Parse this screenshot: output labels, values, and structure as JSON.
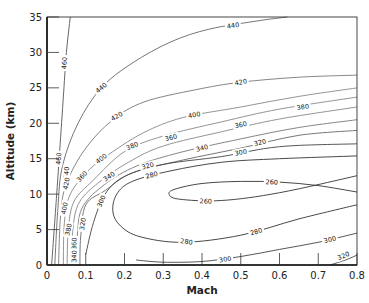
{
  "chart_data": {
    "type": "contour",
    "title": "",
    "xlabel": "Mach",
    "ylabel": "Altitude (km)",
    "xlim": [
      0,
      0.8
    ],
    "ylim": [
      0,
      35
    ],
    "xticks": [
      "0",
      "0.1",
      "0.2",
      "0.3",
      "0.4",
      "0.5",
      "0.6",
      "0.7",
      "0.8"
    ],
    "yticks": [
      "0",
      "5",
      "10",
      "15",
      "20",
      "25",
      "30",
      "35"
    ],
    "grid": false,
    "contours": [
      {
        "level": 460,
        "color": "#555555",
        "points": [
          [
            0.012,
            0
          ],
          [
            0.025,
            10
          ],
          [
            0.035,
            18
          ],
          [
            0.045,
            26
          ],
          [
            0.05,
            30
          ],
          [
            0.06,
            35
          ]
        ],
        "labels": [
          [
            0.045,
            28.5,
            "460"
          ],
          [
            0.03,
            15,
            "460"
          ]
        ]
      },
      {
        "level": 440,
        "color": "#666666",
        "points": [
          [
            0.02,
            0
          ],
          [
            0.028,
            8
          ],
          [
            0.04,
            14
          ],
          [
            0.08,
            20
          ],
          [
            0.14,
            25
          ],
          [
            0.22,
            28.5
          ],
          [
            0.32,
            31.5
          ],
          [
            0.42,
            33.3
          ],
          [
            0.55,
            34.5
          ],
          [
            0.62,
            35
          ]
        ],
        "labels": [
          [
            0.05,
            13,
            "440"
          ],
          [
            0.14,
            25,
            "440"
          ],
          [
            0.48,
            33.8,
            "440"
          ]
        ]
      },
      {
        "level": 420,
        "color": "#777777",
        "points": [
          [
            0.03,
            0
          ],
          [
            0.035,
            7
          ],
          [
            0.05,
            11.5
          ],
          [
            0.1,
            16.5
          ],
          [
            0.17,
            20.5
          ],
          [
            0.25,
            23
          ],
          [
            0.38,
            24.7
          ],
          [
            0.5,
            25.8
          ],
          [
            0.65,
            26.5
          ],
          [
            0.8,
            26.8
          ]
        ],
        "labels": [
          [
            0.05,
            11.5,
            "420"
          ],
          [
            0.18,
            21,
            "420"
          ],
          [
            0.5,
            25.8,
            "420"
          ]
        ]
      },
      {
        "level": 400,
        "color": "#888888",
        "points": [
          [
            0.042,
            0
          ],
          [
            0.045,
            6
          ],
          [
            0.06,
            10
          ],
          [
            0.11,
            13.5
          ],
          [
            0.17,
            16
          ],
          [
            0.25,
            18.7
          ],
          [
            0.35,
            20.8
          ],
          [
            0.5,
            22.3
          ],
          [
            0.65,
            23.8
          ],
          [
            0.8,
            25
          ]
        ],
        "labels": [
          [
            0.045,
            8,
            "400"
          ],
          [
            0.14,
            15,
            "400"
          ],
          [
            0.38,
            21.2,
            "400"
          ]
        ]
      },
      {
        "level": 380,
        "color": "#888888",
        "points": [
          [
            0.052,
            0
          ],
          [
            0.055,
            5
          ],
          [
            0.07,
            9
          ],
          [
            0.12,
            12
          ],
          [
            0.2,
            16
          ],
          [
            0.3,
            18.2
          ],
          [
            0.45,
            20.2
          ],
          [
            0.6,
            22
          ],
          [
            0.8,
            23.7
          ]
        ],
        "labels": [
          [
            0.055,
            5,
            "380"
          ],
          [
            0.22,
            16.8,
            "380"
          ],
          [
            0.66,
            22.3,
            "380"
          ]
        ]
      },
      {
        "level": 360,
        "color": "#888888",
        "points": [
          [
            0.062,
            0
          ],
          [
            0.065,
            4
          ],
          [
            0.08,
            8.5
          ],
          [
            0.13,
            11.5
          ],
          [
            0.21,
            14.5
          ],
          [
            0.3,
            16.8
          ],
          [
            0.45,
            18.8
          ],
          [
            0.6,
            20.6
          ],
          [
            0.8,
            22.3
          ]
        ],
        "labels": [
          [
            0.07,
            3,
            "360"
          ],
          [
            0.09,
            12.5,
            "360"
          ],
          [
            0.32,
            18,
            "360"
          ],
          [
            0.5,
            19.8,
            "360"
          ]
        ]
      },
      {
        "level": 340,
        "color": "#777777",
        "points": [
          [
            0.075,
            0
          ],
          [
            0.078,
            4
          ],
          [
            0.09,
            8
          ],
          [
            0.14,
            11
          ],
          [
            0.22,
            13.7
          ],
          [
            0.33,
            15.7
          ],
          [
            0.5,
            17.8
          ],
          [
            0.65,
            19.4
          ],
          [
            0.8,
            20.5
          ]
        ],
        "labels": [
          [
            0.07,
            1.2,
            "340"
          ],
          [
            0.16,
            12.5,
            "340"
          ],
          [
            0.4,
            16.5,
            "340"
          ]
        ]
      },
      {
        "level": 320,
        "color": "#666666",
        "points": [
          [
            0.085,
            0
          ],
          [
            0.087,
            4
          ],
          [
            0.1,
            8.5
          ],
          [
            0.15,
            10.5
          ],
          [
            0.22,
            13
          ],
          [
            0.35,
            14.8
          ],
          [
            0.5,
            16.5
          ],
          [
            0.65,
            18.3
          ],
          [
            0.8,
            19
          ]
        ],
        "labels": [
          [
            0.092,
            5.8,
            "320"
          ],
          [
            0.26,
            14,
            "320"
          ],
          [
            0.55,
            17.3,
            "320"
          ]
        ]
      },
      {
        "level": 300,
        "color": "#444444",
        "points": [
          [
            0.1,
            1.5
          ],
          [
            0.12,
            6
          ],
          [
            0.15,
            10
          ],
          [
            0.2,
            12.5
          ],
          [
            0.3,
            14.2
          ],
          [
            0.45,
            15.3
          ],
          [
            0.6,
            16.7
          ],
          [
            0.8,
            17.1
          ]
        ],
        "labels": [
          [
            0.14,
            9,
            "300"
          ],
          [
            0.5,
            15.9,
            "300"
          ]
        ]
      },
      {
        "level": 300,
        "color": "#444444",
        "points": [
          [
            0.23,
            0.7
          ],
          [
            0.3,
            0.4
          ],
          [
            0.4,
            0.5
          ],
          [
            0.5,
            1.2
          ],
          [
            0.6,
            2.2
          ],
          [
            0.7,
            3.2
          ],
          [
            0.8,
            4.5
          ]
        ],
        "labels": [
          [
            0.46,
            0.8,
            "300"
          ],
          [
            0.73,
            3.6,
            "300"
          ]
        ]
      },
      {
        "level": 280,
        "color": "#333333",
        "points": [
          [
            0.8,
            15.4
          ],
          [
            0.6,
            15
          ],
          [
            0.45,
            14.5
          ],
          [
            0.32,
            13.3
          ],
          [
            0.22,
            11.8
          ],
          [
            0.18,
            10
          ],
          [
            0.17,
            7.5
          ],
          [
            0.19,
            5.5
          ],
          [
            0.24,
            4
          ],
          [
            0.35,
            3.2
          ],
          [
            0.5,
            4.2
          ],
          [
            0.65,
            6.5
          ],
          [
            0.8,
            8.5
          ]
        ],
        "labels": [
          [
            0.27,
            12.7,
            "280"
          ],
          [
            0.36,
            3.3,
            "280"
          ],
          [
            0.54,
            4.7,
            "280"
          ]
        ]
      },
      {
        "level": 260,
        "color": "#333333",
        "points": [
          [
            0.8,
            10.3
          ],
          [
            0.7,
            11.2
          ],
          [
            0.6,
            11.7
          ],
          [
            0.5,
            11.8
          ],
          [
            0.4,
            11.5
          ],
          [
            0.33,
            10.7
          ],
          [
            0.315,
            10
          ],
          [
            0.34,
            9.3
          ],
          [
            0.45,
            9.1
          ],
          [
            0.6,
            10.2
          ],
          [
            0.8,
            12.6
          ]
        ],
        "labels": [
          [
            0.41,
            9.0,
            "260"
          ],
          [
            0.58,
            11.7,
            "260"
          ]
        ]
      },
      {
        "level": 320,
        "color": "#444444",
        "points": [
          [
            0.73,
            0
          ],
          [
            0.77,
            0.7
          ],
          [
            0.8,
            1.4
          ]
        ],
        "labels": [
          [
            0.765,
            1.3,
            "320"
          ]
        ]
      },
      {
        "level": 280,
        "color": "#333333",
        "points": [
          [
            0.8,
            10
          ],
          [
            0.8,
            10
          ]
        ],
        "labels": []
      }
    ]
  }
}
